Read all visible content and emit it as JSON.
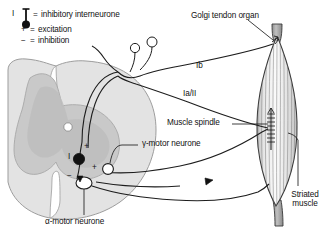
{
  "figure": {
    "background_color": "#ffffff",
    "ink_color": "#111111"
  },
  "legend": {
    "items": [
      {
        "symbol_label": "I",
        "icon": "inhibitory-interneurone-symbol",
        "equals": "=",
        "text": "inhibitory interneurone"
      },
      {
        "symbol_label": "+",
        "icon": "plus-sign",
        "equals": "=",
        "text": "excitation"
      },
      {
        "symbol_label": "−",
        "icon": "minus-sign",
        "equals": "=",
        "text": "inhibition"
      }
    ]
  },
  "callouts": [
    {
      "id": "golgi",
      "text": "Golgi tendon organ"
    },
    {
      "id": "muscle-spindle",
      "text": "Muscle spindle"
    },
    {
      "id": "gamma-motor",
      "text": "γ-motor neurone"
    },
    {
      "id": "alpha-motor",
      "text": "α-motor neurone"
    },
    {
      "id": "striated-muscle",
      "text": "Striated\nmuscle",
      "line1": "Striated",
      "line2": "muscle"
    }
  ],
  "tract_labels": [
    {
      "id": "ib",
      "text": "Ib"
    },
    {
      "id": "ia-ii",
      "text": "Ia/II"
    }
  ],
  "circuit_signs": [
    {
      "id": "sign-excite-interneurone",
      "text": "+"
    },
    {
      "id": "sign-excite-alpha",
      "text": "+"
    },
    {
      "id": "sign-inhibit-alpha",
      "text": "−"
    }
  ],
  "circuit_markers": [
    {
      "id": "interneurone-soma",
      "label": "I",
      "fill": "#111111"
    }
  ],
  "colors": {
    "white_matter": "#e3e3e3",
    "gray_matter": "#c9c9c9",
    "gray_matter_inner": "#bdbdbd",
    "muscle_body": "#d8d8d8",
    "tendon": "#9a9a9a",
    "stroke": "#222222"
  }
}
